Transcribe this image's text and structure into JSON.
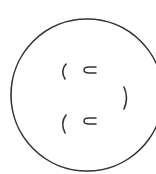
{
  "diagram": {
    "stroke_color": "#333333",
    "background": "#ffffff",
    "circle": {
      "cx": 87,
      "cy": 95,
      "r": 76
    },
    "symbols": [
      {
        "name": "open-paren-top",
        "glyph": "("
      },
      {
        "name": "subset-top",
        "glyph": "⊂"
      },
      {
        "name": "close-paren-right",
        "glyph": ")"
      },
      {
        "name": "open-paren-bottom",
        "glyph": "("
      },
      {
        "name": "subset-bottom",
        "glyph": "⊂"
      }
    ]
  }
}
